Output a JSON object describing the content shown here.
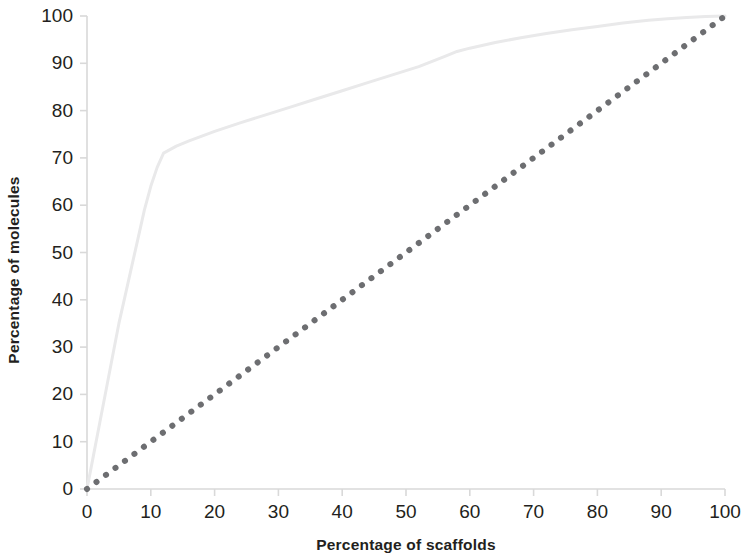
{
  "chart_data": {
    "type": "line",
    "title": "",
    "subtitle": "",
    "xlabel": "Percentage of scaffolds",
    "ylabel": "Percentage of molecules",
    "xlim": [
      0,
      100
    ],
    "ylim": [
      0,
      100
    ],
    "grid": false,
    "legend": "none",
    "xticks": [
      0,
      10,
      20,
      30,
      40,
      50,
      60,
      70,
      80,
      90,
      100
    ],
    "yticks": [
      0,
      10,
      20,
      30,
      40,
      50,
      60,
      70,
      80,
      90,
      100
    ],
    "xtick_labels": [
      "0",
      "10",
      "20",
      "30",
      "40",
      "50",
      "60",
      "70",
      "80",
      "90",
      "100"
    ],
    "ytick_labels": [
      "0",
      "10",
      "20",
      "30",
      "40",
      "50",
      "60",
      "70",
      "80",
      "90",
      "100"
    ],
    "series": [
      {
        "name": "Cumulative molecule coverage",
        "style": "solid",
        "color": "#e9e9ea",
        "width": 3,
        "x": [
          0,
          1,
          2,
          3,
          4,
          5,
          6,
          7,
          8,
          9,
          10,
          11,
          12,
          14,
          16,
          18,
          20,
          24,
          28,
          32,
          36,
          40,
          44,
          48,
          52,
          56,
          58,
          60,
          64,
          68,
          72,
          76,
          80,
          84,
          88,
          91,
          94,
          97,
          100
        ],
        "y": [
          0,
          7,
          14,
          21,
          28,
          35,
          41,
          47,
          53,
          59,
          64,
          68,
          71,
          72.5,
          73.6,
          74.6,
          75.6,
          77.4,
          79.1,
          80.8,
          82.5,
          84.2,
          85.9,
          87.6,
          89.3,
          91.4,
          92.5,
          93.2,
          94.4,
          95.4,
          96.3,
          97.1,
          97.8,
          98.5,
          99.1,
          99.4,
          99.7,
          99.9,
          100
        ]
      },
      {
        "name": "Diagonal reference (y = x)",
        "style": "dotted",
        "color": "#6d6e71",
        "width": 6,
        "x": [
          0,
          100
        ],
        "y": [
          0,
          100
        ]
      }
    ],
    "axis_color": "#d9d9d9",
    "text_color": "#231f20"
  },
  "axes": {
    "x_title": "Percentage of scaffolds",
    "y_title": "Percentage of molecules"
  },
  "ticks": {
    "x": [
      "0",
      "10",
      "20",
      "30",
      "40",
      "50",
      "60",
      "70",
      "80",
      "90",
      "100"
    ],
    "y": [
      "0",
      "10",
      "20",
      "30",
      "40",
      "50",
      "60",
      "70",
      "80",
      "90",
      "100"
    ]
  }
}
